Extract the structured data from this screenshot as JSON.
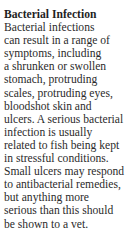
{
  "section": {
    "heading": "Bacterial Infection",
    "lines": [
      "Bacterial infections",
      "can result in a range of",
      "symptoms, including",
      "a shrunken or swollen",
      "stomach, protruding",
      "scales, protruding eyes,",
      "bloodshot skin and",
      "ulcers. A serious bacterial",
      "infection is usually",
      "related to fish being kept",
      "in stressful conditions.",
      "Small ulcers may respond",
      "to antibacterial remedies,",
      "but anything more",
      "serious than this should",
      "be shown to a vet."
    ]
  }
}
